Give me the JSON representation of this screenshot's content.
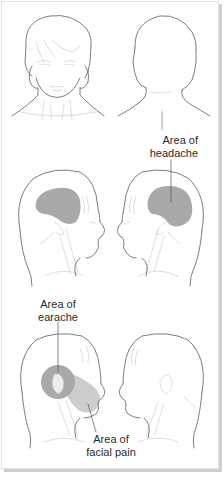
{
  "figure": {
    "panels": [
      {
        "id": "front",
        "view": "front view of head",
        "highlight": null
      },
      {
        "id": "back",
        "view": "back view of head",
        "highlight": null
      },
      {
        "id": "left-profile-headache",
        "view": "left-facing profile",
        "highlight": "headache"
      },
      {
        "id": "right-profile-headache",
        "view": "right-facing profile",
        "highlight": "headache"
      },
      {
        "id": "left-profile-ear-face",
        "view": "left-facing profile",
        "highlight": "earache and facial pain"
      },
      {
        "id": "right-profile-plain",
        "view": "right-facing profile",
        "highlight": null
      }
    ],
    "labels": {
      "headache": {
        "line1": "Area of",
        "line2": "headache"
      },
      "earache": {
        "line1": "Area of",
        "line2": "earache"
      },
      "facial_pain": {
        "line1": "Area of",
        "line2": "facial pain"
      }
    },
    "colors": {
      "outline": "#6e6e6e",
      "detail": "#cfcfcf",
      "headache_fill": "#a9a9a9",
      "earache_fill": "#a9a9a9",
      "facial_pain_fill": "#cdcdcd",
      "frame_shadow": "#cfcfcf"
    }
  }
}
